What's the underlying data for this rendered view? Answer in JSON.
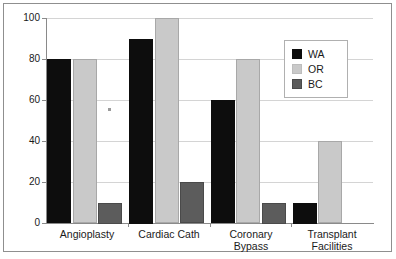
{
  "chart_data": {
    "type": "bar",
    "title": "",
    "subtitle": "",
    "xlabel": "",
    "ylabel": "",
    "ylim": [
      0,
      100
    ],
    "ytick_values": [
      0,
      20,
      40,
      60,
      80,
      100
    ],
    "ytick_labels": [
      "0",
      "20",
      "40",
      "60",
      "80",
      "100"
    ],
    "grid": true,
    "legend_position": "upper-right",
    "categories": [
      "Angioplasty",
      "Cardiac Cath",
      "Coronary\nBypass",
      "Transplant\nFacilities"
    ],
    "category_lines": [
      [
        "Angioplasty"
      ],
      [
        "Cardiac Cath"
      ],
      [
        "Coronary",
        "Bypass"
      ],
      [
        "Transplant",
        "Facilities"
      ]
    ],
    "series": [
      {
        "name": "WA",
        "color": "#0d0d0d",
        "values": [
          80,
          90,
          60,
          10
        ]
      },
      {
        "name": "OR",
        "color": "#c9c9c9",
        "values": [
          80,
          100,
          80,
          40
        ]
      },
      {
        "name": "BC",
        "color": "#5c5c5c",
        "values": [
          10,
          20,
          10,
          0
        ]
      }
    ]
  },
  "legend": {
    "entries": [
      {
        "label": "WA",
        "swatch": "wa"
      },
      {
        "label": "OR",
        "swatch": "or"
      },
      {
        "label": "BC",
        "swatch": "bc"
      }
    ]
  },
  "colors": {
    "wa": "#0d0d0d",
    "or": "#c9c9c9",
    "bc": "#5c5c5c",
    "gridline": "#d4d4d4",
    "axis": "#8a8a8a",
    "frame": "#8f8f8f",
    "text": "#1a1a1a",
    "background": "#ffffff"
  }
}
